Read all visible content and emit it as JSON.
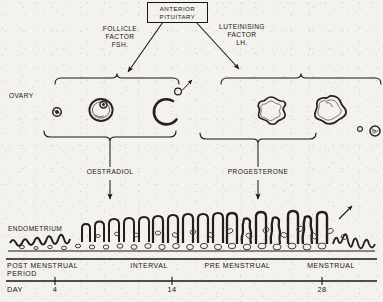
{
  "diagram": {
    "source_section": "OVARY / ENDOMETRIUM"
  },
  "pituitary": {
    "line1": "ANTERIOR",
    "line2": "PITUITARY"
  },
  "hormones": {
    "fsh": {
      "line1": "FOLLICLE",
      "line2": "FACTOR",
      "line3": "FSH."
    },
    "lh": {
      "line1": "LUTEINISING",
      "line2": "FACTOR",
      "line3": "LH."
    },
    "oestradiol": "OESTRADIOL",
    "progesterone": "PROGESTERONE"
  },
  "organs": {
    "ovary_label": "OVARY",
    "endometrium_label": "ENDOMETRIUM"
  },
  "ovary_stages": [
    {
      "name": "primordial-follicle",
      "cx": 57,
      "cy": 112,
      "r": 4.2
    },
    {
      "name": "graafian-follicle",
      "cx": 101,
      "cy": 109,
      "r": 11.5
    },
    {
      "name": "ovulation-rupture",
      "cx": 168,
      "cy": 112,
      "r": 12.5
    },
    {
      "name": "released-ovum",
      "cx": 178,
      "cy": 92,
      "r": 3.4
    },
    {
      "name": "corpus-luteum-early",
      "cx": 271,
      "cy": 110,
      "r": 13
    },
    {
      "name": "corpus-luteum-late",
      "cx": 331,
      "cy": 110,
      "r": 14
    },
    {
      "name": "corpus-albicans-small",
      "cx": 360,
      "cy": 129,
      "r": 2.6
    },
    {
      "name": "corpus-albicans",
      "cx": 375,
      "cy": 131,
      "r": 5
    }
  ],
  "timeline": {
    "phases": [
      {
        "label_line1": "POST MENSTRUAL",
        "label_line2": "PERIOD",
        "start": 6,
        "end": 108
      },
      {
        "label_line1": "INTERVAL",
        "label_line2": "",
        "start": 108,
        "end": 190
      },
      {
        "label_line1": "PRE MENSTRUAL",
        "label_line2": "",
        "start": 190,
        "end": 285
      },
      {
        "label_line1": "MENSTRUAL",
        "label_line2": "",
        "start": 285,
        "end": 377
      }
    ],
    "day_label": "DAY",
    "ticks": [
      {
        "day": "4",
        "x": 55
      },
      {
        "day": "14",
        "x": 172
      },
      {
        "day": "28",
        "x": 322
      }
    ]
  },
  "colors": {
    "ink": "#1a1713",
    "paper": "#f4f2ee",
    "faded_ink": "#3b352c"
  }
}
